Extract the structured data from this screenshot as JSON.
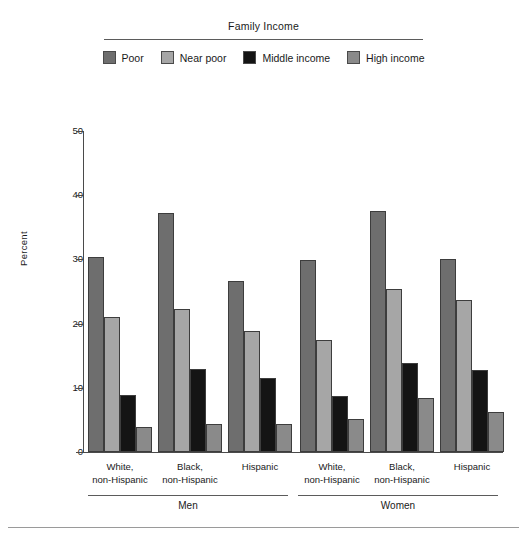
{
  "legend": {
    "title": "Family Income",
    "items": [
      {
        "label": "Poor",
        "color": "#6e6e6e"
      },
      {
        "label": "Near poor",
        "color": "#a6a6a6"
      },
      {
        "label": "Middle income",
        "color": "#141414"
      },
      {
        "label": "High income",
        "color": "#8a8a8a"
      }
    ]
  },
  "chart_data": {
    "type": "bar",
    "title": "Family Income",
    "xlabel": "",
    "ylabel": "Percent",
    "ylim": [
      0,
      50
    ],
    "yticks": [
      0,
      10,
      20,
      30,
      40,
      50
    ],
    "grid": false,
    "legend_position": "top",
    "categories": [
      "White, non-Hispanic",
      "Black, non-Hispanic",
      "Hispanic",
      "White, non-Hispanic",
      "Black, non-Hispanic",
      "Hispanic"
    ],
    "groups": [
      {
        "name": "Men",
        "categories": [
          "White, non-Hispanic",
          "Black, non-Hispanic",
          "Hispanic"
        ]
      },
      {
        "name": "Women",
        "categories": [
          "White, non-Hispanic",
          "Black, non-Hispanic",
          "Hispanic"
        ]
      }
    ],
    "series": [
      {
        "name": "Poor",
        "color": "#6e6e6e",
        "values": [
          30.3,
          37.2,
          26.7,
          29.9,
          37.6,
          30.0
        ]
      },
      {
        "name": "Near poor",
        "color": "#a6a6a6",
        "values": [
          21.1,
          22.2,
          18.8,
          17.4,
          25.4,
          23.7
        ]
      },
      {
        "name": "Middle income",
        "color": "#141414",
        "values": [
          8.9,
          12.9,
          11.5,
          8.7,
          13.9,
          12.7
        ]
      },
      {
        "name": "High income",
        "color": "#8a8a8a",
        "values": [
          3.9,
          4.4,
          4.4,
          5.1,
          8.4,
          6.3
        ]
      }
    ]
  },
  "axis": {
    "y_title": "Percent",
    "y_ticks": [
      "0",
      "10",
      "20",
      "30",
      "40",
      "50"
    ]
  },
  "cat_labels": [
    {
      "line1": "White,",
      "line2": "non-Hispanic"
    },
    {
      "line1": "Black,",
      "line2": "non-Hispanic"
    },
    {
      "line1": "Hispanic",
      "line2": ""
    },
    {
      "line1": "White,",
      "line2": "non-Hispanic"
    },
    {
      "line1": "Black,",
      "line2": "non-Hispanic"
    },
    {
      "line1": "Hispanic",
      "line2": ""
    }
  ],
  "sex_labels": [
    "Men",
    "Women"
  ]
}
